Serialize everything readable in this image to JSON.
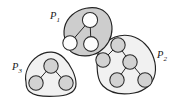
{
  "figure": {
    "type": "graph-partition-diagram",
    "background_color": "#ffffff"
  },
  "colors": {
    "outline": "#232323",
    "node_stroke": "#2a2a2a",
    "edge_stroke": "#2a2a2a",
    "blob_fill_dark": "#cdcdcd",
    "blob_fill_light": "#f1f1f1",
    "node_fill_white": "#fdfdfd",
    "node_fill_gray": "#d2d2d2",
    "label_color": "#1a1a1a"
  },
  "groups": [
    {
      "id": "P1",
      "label_base": "P",
      "label_sub": "1",
      "label_x": 50,
      "label_y": 19,
      "fill": "#cdcdcd",
      "node_fill": "#fdfdfd",
      "outline_path": "M 66 41 C 62 33 64 22 72 15 C 80 8 92 6 100 9 C 108 12 112 20 112 29 C 112 38 107 47 99 52 C 91 57 80 57 73 53 C 69 51 67 46 66 41 Z",
      "nodes": [
        {
          "id": "p1-n1",
          "cx": 90,
          "cy": 20,
          "r": 7.6
        },
        {
          "id": "p1-n2",
          "cx": 70,
          "cy": 43,
          "r": 7.2
        },
        {
          "id": "p1-n3",
          "cx": 91,
          "cy": 44,
          "r": 7.4
        }
      ],
      "edges": [
        {
          "from": "p1-n1",
          "to": "p1-n2"
        },
        {
          "from": "p1-n1",
          "to": "p1-n3"
        }
      ]
    },
    {
      "id": "P2",
      "label_base": "P",
      "label_sub": "2",
      "label_x": 157,
      "label_y": 58,
      "fill": "#f1f1f1",
      "node_fill": "#d2d2d2",
      "outline_path": "M 97 60 C 97 50 105 41 115 37 C 126 33 137 36 145 44 C 153 52 157 64 155 74 C 153 84 145 91 134 93 C 122 95 110 93 103 86 C 97 80 97 69 97 60 Z",
      "nodes": [
        {
          "id": "p2-n1",
          "cx": 118,
          "cy": 45,
          "r": 7.2
        },
        {
          "id": "p2-n2",
          "cx": 103,
          "cy": 60,
          "r": 7.2
        },
        {
          "id": "p2-n3",
          "cx": 130,
          "cy": 62,
          "r": 7.2
        },
        {
          "id": "p2-n4",
          "cx": 117,
          "cy": 80,
          "r": 7.2
        },
        {
          "id": "p2-n5",
          "cx": 145,
          "cy": 80,
          "r": 7.2
        }
      ],
      "edges": [
        {
          "from": "p2-n1",
          "to": "p2-n2"
        },
        {
          "from": "p2-n1",
          "to": "p2-n3"
        },
        {
          "from": "p2-n3",
          "to": "p2-n4"
        },
        {
          "from": "p2-n3",
          "to": "p2-n5"
        }
      ]
    },
    {
      "id": "P3",
      "label_base": "P",
      "label_sub": "3",
      "label_x": 12,
      "label_y": 70,
      "fill": "#f1f1f1",
      "node_fill": "#d2d2d2",
      "outline_path": "M 26 82 C 24 73 29 62 38 56 C 47 50 57 51 64 58 C 71 65 76 76 76 84 C 76 91 70 95 59 96 C 47 97 35 96 30 92 C 27 90 26 86 26 82 Z",
      "nodes": [
        {
          "id": "p3-n1",
          "cx": 51,
          "cy": 66,
          "r": 7.2
        },
        {
          "id": "p3-n2",
          "cx": 36,
          "cy": 83,
          "r": 7.2
        },
        {
          "id": "p3-n3",
          "cx": 66,
          "cy": 83,
          "r": 7.2
        }
      ],
      "edges": [
        {
          "from": "p3-n1",
          "to": "p3-n2"
        },
        {
          "from": "p3-n1",
          "to": "p3-n3"
        }
      ]
    }
  ]
}
